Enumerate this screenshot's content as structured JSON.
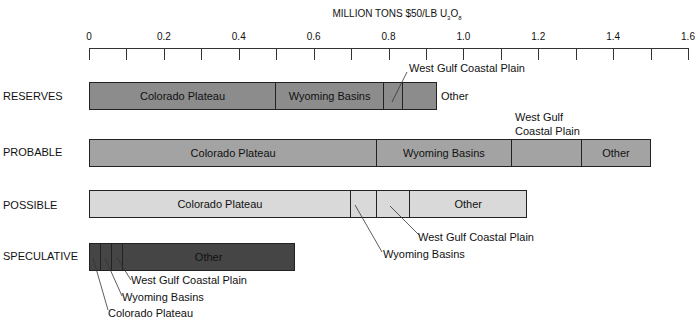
{
  "chart_data": {
    "type": "bar",
    "orientation": "horizontal-stacked",
    "title": "MILLION TONS $50/LB U3O8",
    "xlabel": "MILLION TONS $50/LB U3O8",
    "ylabel": "",
    "xlim": [
      0,
      1.6
    ],
    "x_ticks": [
      "0",
      "0.2",
      "0.4",
      "0.6",
      "0.8",
      "1.0",
      "1.2",
      "1.4",
      "1.6"
    ],
    "minor_tick_step": 0.1,
    "grid": false,
    "legend": "none (inline labels)",
    "categories": [
      "RESERVES",
      "PROBABLE",
      "POSSIBLE",
      "SPECULATIVE"
    ],
    "series": [
      {
        "name": "Colorado Plateau",
        "values": [
          0.5,
          0.77,
          0.7,
          0.03
        ]
      },
      {
        "name": "Wyoming Basins",
        "values": [
          0.29,
          0.36,
          0.07,
          0.03
        ]
      },
      {
        "name": "West Gulf Coastal Plain",
        "values": [
          0.05,
          0.19,
          0.09,
          0.03
        ]
      },
      {
        "name": "Other",
        "values": [
          0.09,
          0.18,
          0.31,
          0.46
        ]
      }
    ],
    "totals": [
      0.93,
      1.51,
      1.18,
      0.55
    ],
    "bar_colors": [
      "#8c8c8c",
      "#a3a3a3",
      "#d9d9d9",
      "#454545"
    ]
  },
  "title_main": "MILLION TONS $50/LB U",
  "title_sub1": "3",
  "title_mid": "O",
  "title_sub2": "8",
  "rows": [
    {
      "label": "RESERVES"
    },
    {
      "label": "PROBABLE"
    },
    {
      "label": "POSSIBLE"
    },
    {
      "label": "SPECULATIVE"
    }
  ],
  "labels": {
    "colorado": "Colorado Plateau",
    "wyoming": "Wyoming Basins",
    "westgulf": "West Gulf Coastal Plain",
    "westgulf_l1": "West Gulf",
    "westgulf_l2": "Coastal Plain",
    "other": "Other"
  }
}
